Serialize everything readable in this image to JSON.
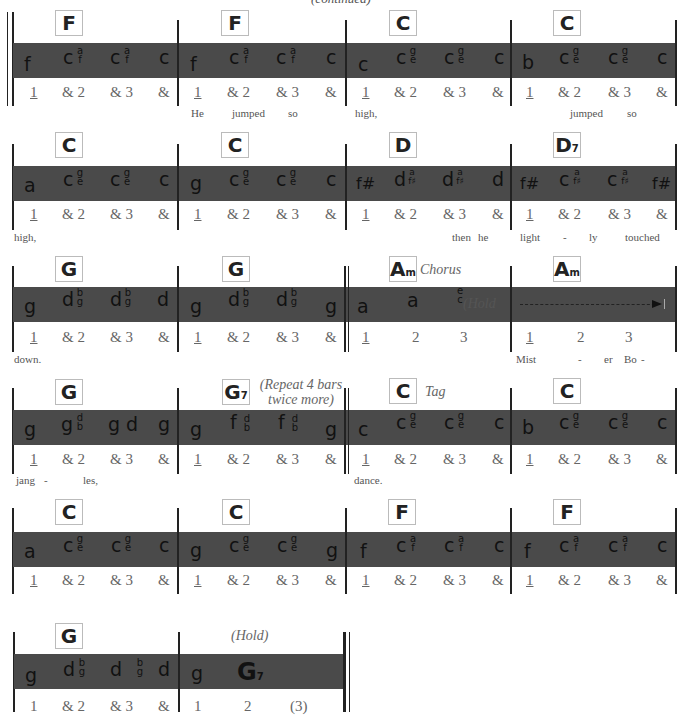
{
  "header": {
    "text": "(continued)"
  },
  "rows": [
    {
      "measures": [
        {
          "chord": "F",
          "bass": "f",
          "strum": [
            [
              "c",
              "a",
              "f"
            ],
            [
              "c",
              "a",
              "f"
            ]
          ],
          "last": "c",
          "counts": [
            "1",
            "& 2",
            "& 3",
            "&"
          ]
        },
        {
          "chord": "F",
          "bass": "f",
          "strum": [
            [
              "c",
              "a",
              "f"
            ],
            [
              "c",
              "a",
              "f"
            ]
          ],
          "last": "c",
          "counts": [
            "1",
            "& 2",
            "& 3",
            "&"
          ]
        },
        {
          "chord": "C",
          "bass": "c",
          "strum": [
            [
              "c",
              "g",
              "e"
            ],
            [
              "c",
              "g",
              "e"
            ]
          ],
          "last": "c",
          "counts": [
            "1",
            "& 2",
            "& 3",
            "&"
          ]
        },
        {
          "chord": "C",
          "bass": "b",
          "strum": [
            [
              "c",
              "g",
              "e"
            ],
            [
              "c",
              "g",
              "e"
            ]
          ],
          "last": "c",
          "counts": [
            "1",
            "& 2",
            "& 3",
            "&"
          ]
        }
      ],
      "lyrics": [
        "He",
        "jumped",
        "so",
        "high,",
        "jumped",
        "so"
      ]
    },
    {
      "measures": [
        {
          "chord": "C",
          "bass": "a",
          "strum": [
            [
              "c",
              "g",
              "e"
            ],
            [
              "c",
              "g",
              "e"
            ]
          ],
          "last": "c",
          "counts": [
            "1",
            "& 2",
            "& 3",
            "&"
          ]
        },
        {
          "chord": "C",
          "bass": "g",
          "strum": [
            [
              "c",
              "g",
              "e"
            ],
            [
              "c",
              "g",
              "e"
            ]
          ],
          "last": "c",
          "counts": [
            "1",
            "& 2",
            "& 3",
            "&"
          ]
        },
        {
          "chord": "D",
          "bass": "f#",
          "strum": [
            [
              "d",
              "a",
              "f♯"
            ],
            [
              "d",
              "a",
              "f♯"
            ]
          ],
          "last": "d",
          "counts": [
            "1",
            "& 2",
            "& 3",
            "&"
          ]
        },
        {
          "chord": "D",
          "chord_sub": "7",
          "bass": "f#",
          "strum": [
            [
              "c",
              "a",
              "f♯"
            ],
            [
              "c",
              "a",
              "f♯"
            ]
          ],
          "last": "f#",
          "counts": [
            "1",
            "& 2",
            "& 3",
            "&"
          ]
        }
      ],
      "lyrics": [
        "high,",
        "then",
        "he",
        "light",
        "-",
        "ly",
        "touched"
      ]
    },
    {
      "measures": [
        {
          "chord": "G",
          "bass": "g",
          "strum": [
            [
              "d",
              "b",
              "g"
            ],
            [
              "d",
              "b",
              "g"
            ]
          ],
          "last": "d",
          "counts": [
            "1",
            "& 2",
            "& 3",
            "&"
          ]
        },
        {
          "chord": "G",
          "bass": "g",
          "strum": [
            [
              "d",
              "b",
              "g"
            ],
            [
              "d",
              "b",
              "g"
            ]
          ],
          "last": "g",
          "counts": [
            "1",
            "& 2",
            "& 3",
            "&"
          ]
        },
        {
          "chord": "A",
          "chord_sub": "m",
          "label": "Chorus",
          "bass": "a",
          "note2": "a",
          "stack3": [
            "e",
            "c"
          ],
          "hold": "(Hold",
          "counts": [
            "1",
            "2",
            "3"
          ]
        },
        {
          "chord": "A",
          "chord_sub": "m",
          "counts": [
            "1",
            "2",
            "3"
          ]
        }
      ],
      "lyrics": [
        "down.",
        "Mist",
        "-",
        "er",
        "Bo",
        "-"
      ]
    },
    {
      "measures": [
        {
          "chord": "G",
          "bass": "g",
          "n2": "g",
          "s2": [
            "d",
            "b"
          ],
          "n3": "g d",
          "last": "g",
          "counts": [
            "1",
            "& 2",
            "& 3",
            "&"
          ]
        },
        {
          "chord": "G",
          "chord_sub": "7",
          "note": "(Repeat 4 bars twice more)",
          "note_line1": "(Repeat 4 bars",
          "note_line2": "twice more)",
          "bass": "g",
          "strum": [
            [
              "f",
              "d",
              "b"
            ],
            [
              "f",
              "d",
              "b"
            ]
          ],
          "last": "g",
          "counts": [
            "1",
            "& 2",
            "& 3",
            "&"
          ]
        },
        {
          "chord": "C",
          "label": "Tag",
          "bass": "c",
          "strum": [
            [
              "c",
              "g",
              "e"
            ],
            [
              "c",
              "g",
              "e"
            ]
          ],
          "last": "c",
          "counts": [
            "1",
            "& 2",
            "& 3",
            "&"
          ]
        },
        {
          "chord": "C",
          "bass": "b",
          "strum": [
            [
              "c",
              "g",
              "e"
            ],
            [
              "c",
              "g",
              "e"
            ]
          ],
          "last": "c",
          "counts": [
            "1",
            "& 2",
            "& 3",
            "&"
          ]
        }
      ],
      "lyrics": [
        "jang",
        "-",
        "les,",
        "dance."
      ]
    },
    {
      "measures": [
        {
          "chord": "C",
          "bass": "a",
          "strum": [
            [
              "c",
              "g",
              "e"
            ],
            [
              "c",
              "g",
              "e"
            ]
          ],
          "last": "c",
          "counts": [
            "1",
            "& 2",
            "& 3",
            "&"
          ]
        },
        {
          "chord": "C",
          "bass": "g",
          "strum": [
            [
              "c",
              "g",
              "e"
            ],
            [
              "c",
              "g",
              "e"
            ]
          ],
          "last": "g",
          "counts": [
            "1",
            "& 2",
            "& 3",
            "&"
          ]
        },
        {
          "chord": "F",
          "bass": "f",
          "strum": [
            [
              "c",
              "a",
              "f"
            ],
            [
              "c",
              "a",
              "f"
            ]
          ],
          "last": "c",
          "counts": [
            "1",
            "& 2",
            "& 3",
            "&"
          ]
        },
        {
          "chord": "F",
          "bass": "f",
          "strum": [
            [
              "c",
              "a",
              "f"
            ],
            [
              "c",
              "a",
              "f"
            ]
          ],
          "last": "c",
          "counts": [
            "1",
            "& 2",
            "& 3",
            "&"
          ]
        }
      ]
    },
    {
      "measures": [
        {
          "chord": "G",
          "bass": "g",
          "n2": "d",
          "s2": [
            "b",
            "g"
          ],
          "n3": "d",
          "s3": [
            "b",
            "g"
          ],
          "last": "d",
          "counts": [
            "1",
            "& 2",
            "& 3",
            "&"
          ]
        },
        {
          "label": "(Hold)",
          "bass": "g",
          "big_chord": "G",
          "big_chord_sub": "7",
          "counts": [
            "1",
            "2",
            "(3)"
          ]
        }
      ]
    }
  ],
  "colors": {
    "band": "#4a4a4a",
    "barline": "#222222",
    "chord_box_border": "#bbbbbb",
    "count_text": "#666666"
  }
}
